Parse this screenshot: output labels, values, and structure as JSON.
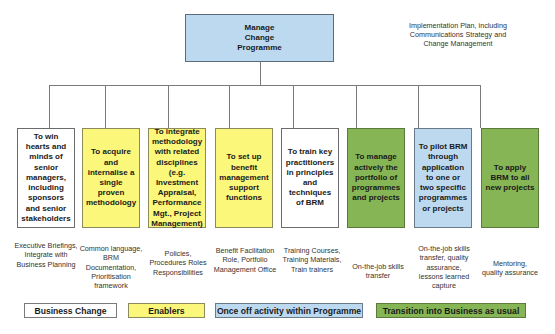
{
  "diagram": {
    "root": {
      "label": "Manage Change Programme",
      "lines": [
        "Manage",
        "Change",
        "Programme"
      ]
    },
    "root_note": "Implementation Plan, including Communications Strategy and Change Management",
    "objectives": [
      {
        "label": "To win hearts and minds of senior managers, including sponsors and senior stakeholders",
        "category": "Business Change",
        "fill": "#ffffff",
        "description": "Executive Briefings, Integrate with Business Planning"
      },
      {
        "label": "To acquire and internalise a single proven methodology",
        "category": "Enablers",
        "fill": "#fbf77a",
        "description": "Common language, BRM Documentation, Prioritisation framework"
      },
      {
        "label": "To integrate methodology with related disciplines (e.g. Investment Appraisal, Performance Mgt., Project Management)",
        "category": "Enablers",
        "fill": "#fbf77a",
        "description": "Policies, Procedures Roles Responsibilities"
      },
      {
        "label": "To set up benefit management support functions",
        "category": "Enablers",
        "fill": "#fbf77a",
        "description": "Benefit Facilitation Role, Portfolio Management Office"
      },
      {
        "label": "To train key practitioners in principles and techniques of BRM",
        "category": "Business Change",
        "fill": "#ffffff",
        "description": "Training Courses, Training Materials, Train trainers"
      },
      {
        "label": "To manage actively the portfolio of programmes and projects",
        "category": "Transition into Business as usual",
        "fill": "#86b555",
        "description": "On-the-job skills transfer"
      },
      {
        "label": "To pilot BRM through application to one or two specific programmes or projects",
        "category": "Once off activity within Programme",
        "fill": "#bcd9ef",
        "description": "On-the-job skills transfer, quality assurance, lessons learned capture"
      },
      {
        "label": "To apply BRM to all new projects",
        "category": "Transition into Business as usual",
        "fill": "#86b555",
        "description": "Mentoring, quality assurance"
      }
    ]
  },
  "legend": [
    {
      "label": "Business Change",
      "color": "#ffffff"
    },
    {
      "label": "Enablers",
      "color": "#fbf77a"
    },
    {
      "label": "Once off activity within Programme",
      "color": "#bcd9ef"
    },
    {
      "label": "Transition into Business as usual",
      "color": "#86b555"
    }
  ]
}
